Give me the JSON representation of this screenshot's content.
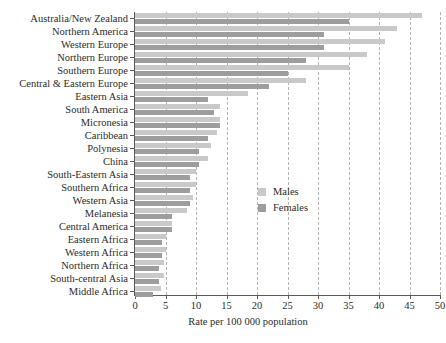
{
  "chart_data": {
    "type": "bar",
    "orientation": "horizontal",
    "title": "",
    "xlabel": "Rate per 100 000 population",
    "ylabel": "",
    "xlim": [
      0,
      50
    ],
    "xticks": [
      0,
      5,
      10,
      15,
      20,
      25,
      30,
      35,
      40,
      45,
      50
    ],
    "grid": true,
    "legend_position": "middle-right-inside",
    "categories": [
      "Australia/New Zealand",
      "Northern America",
      "Western Europe",
      "Northern Europe",
      "Southern Europe",
      "Central & Eastern Europe",
      "Eastern Asia",
      "South America",
      "Micronesia",
      "Caribbean",
      "Polynesia",
      "China",
      "South-Eastern Asia",
      "Southern Africa",
      "Western Asia",
      "Melanesia",
      "Central America",
      "Eastern Africa",
      "Western Africa",
      "Northern Africa",
      "South-central Asia",
      "Middle Africa"
    ],
    "series": [
      {
        "name": "Males",
        "color": "#c9c9c9",
        "values": [
          47.0,
          43.0,
          41.0,
          38.0,
          35.0,
          28.0,
          18.5,
          14.0,
          14.0,
          13.5,
          12.5,
          12.0,
          10.0,
          10.0,
          9.5,
          8.5,
          6.0,
          5.0,
          5.0,
          4.8,
          4.8,
          4.2
        ]
      },
      {
        "name": "Females",
        "color": "#9d9d9d",
        "values": [
          35.0,
          31.0,
          31.0,
          28.0,
          25.0,
          22.0,
          12.0,
          13.0,
          14.0,
          12.0,
          10.5,
          10.5,
          9.0,
          9.0,
          9.0,
          6.0,
          6.0,
          4.5,
          4.5,
          4.0,
          4.0,
          3.0
        ]
      }
    ]
  },
  "legend": {
    "items": [
      {
        "label": "Males",
        "color": "#c9c9c9"
      },
      {
        "label": "Females",
        "color": "#9d9d9d"
      }
    ]
  },
  "axis": {
    "x_title": "Rate per 100 000 population"
  }
}
